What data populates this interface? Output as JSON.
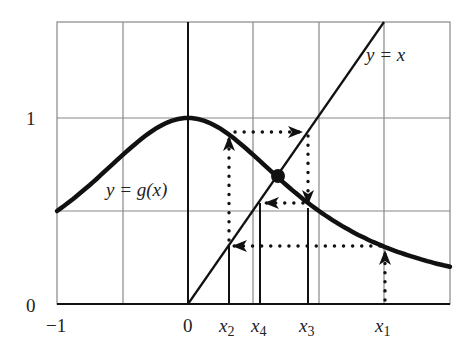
{
  "figure": {
    "function_label": "y = g(x)",
    "identity_label": "y = x",
    "y_ticks": [
      {
        "label": "0",
        "value": 0
      },
      {
        "label": "1",
        "value": 1
      }
    ],
    "x_ticks": [
      {
        "label": "−1",
        "value": -1
      },
      {
        "label": "0",
        "value": 0
      },
      {
        "label": "x2",
        "value": 0.31
      },
      {
        "label": "x4",
        "value": 0.55
      },
      {
        "label": "x3",
        "value": 0.92
      },
      {
        "label": "x1",
        "value": 1.5
      }
    ]
  },
  "chart_data": {
    "type": "line",
    "title": "",
    "xlabel": "",
    "ylabel": "",
    "xlim": [
      -1,
      2
    ],
    "ylim": [
      0,
      1.5
    ],
    "grid": true,
    "grid_step": {
      "x": 0.5,
      "y": 0.5
    },
    "series": [
      {
        "name": "y = g(x)",
        "formula": "1/(1+x^2)",
        "style": "thick solid"
      },
      {
        "name": "y = x",
        "formula": "x",
        "domain": [
          0,
          1.5
        ],
        "style": "solid"
      }
    ],
    "fixed_point": {
      "x": 0.68,
      "y": 0.68
    },
    "iterates": [
      {
        "name": "x1",
        "x": 1.5,
        "g": 0.31
      },
      {
        "name": "x2",
        "x": 0.31,
        "g": 0.91
      },
      {
        "name": "x3",
        "x": 0.91,
        "g": 0.55
      },
      {
        "name": "x4",
        "x": 0.55,
        "g": 0.77
      }
    ],
    "annotations": [
      "dotted cobweb path with arrows converging to fixed point"
    ]
  }
}
